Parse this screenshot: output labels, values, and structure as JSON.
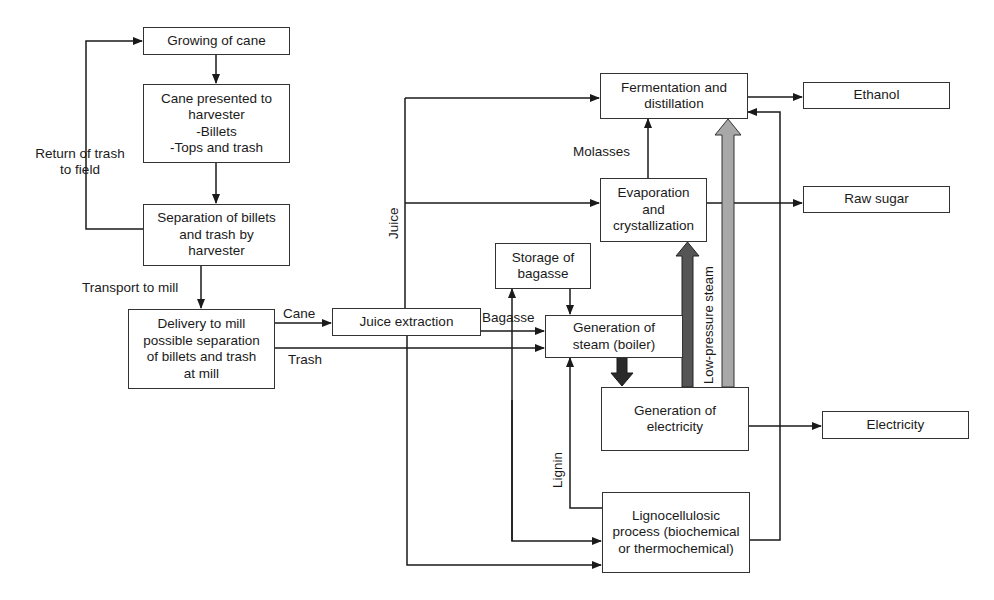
{
  "diagram": {
    "type": "process-flowchart",
    "nodes": {
      "growing": {
        "lines": [
          "Growing of cane"
        ]
      },
      "presented": {
        "lines": [
          "Cane presented to",
          "harvester",
          "-Billets",
          "-Tops and trash"
        ]
      },
      "separation": {
        "lines": [
          "Separation of billets",
          "and trash by",
          "harvester"
        ]
      },
      "delivery": {
        "lines": [
          "Delivery to mill",
          "possible separation",
          "of billets and trash",
          "at mill"
        ]
      },
      "juice_extraction": {
        "lines": [
          "Juice extraction"
        ]
      },
      "fermentation": {
        "lines": [
          "Fermentation and",
          "distillation"
        ]
      },
      "evaporation": {
        "lines": [
          "Evaporation",
          "and",
          "crystallization"
        ]
      },
      "storage": {
        "lines": [
          "Storage of",
          "bagasse"
        ]
      },
      "steam": {
        "lines": [
          "Generation of",
          "steam (boiler)"
        ]
      },
      "electricity_gen": {
        "lines": [
          "Generation of",
          "electricity"
        ]
      },
      "lignocellulosic": {
        "lines": [
          "Lignocellulosic",
          "process (biochemical",
          "or thermochemical)"
        ]
      },
      "ethanol": {
        "lines": [
          "Ethanol"
        ]
      },
      "raw_sugar": {
        "lines": [
          "Raw sugar"
        ]
      },
      "electricity": {
        "lines": [
          "Electricity"
        ]
      }
    },
    "edge_labels": {
      "return_trash": [
        "Return of trash",
        "to field"
      ],
      "transport": "Transport to mill",
      "cane": "Cane",
      "trash": "Trash",
      "bagasse": "Bagasse",
      "juice": "Juice",
      "molasses": "Molasses",
      "low_pressure_steam": "Low-pressure steam",
      "lignin": "Lignin"
    },
    "edges": [
      {
        "from": "growing",
        "to": "presented"
      },
      {
        "from": "presented",
        "to": "separation"
      },
      {
        "from": "separation",
        "to": "growing",
        "label": "Return of trash to field"
      },
      {
        "from": "separation",
        "to": "delivery",
        "label": "Transport to mill"
      },
      {
        "from": "delivery",
        "to": "juice_extraction",
        "label": "Cane"
      },
      {
        "from": "delivery",
        "to": "steam",
        "label": "Trash"
      },
      {
        "from": "juice_extraction",
        "to": "steam",
        "label": "Bagasse"
      },
      {
        "from": "juice_extraction",
        "to": "fermentation",
        "label": "Juice"
      },
      {
        "from": "juice_extraction",
        "to": "evaporation",
        "label": "Juice"
      },
      {
        "from": "juice_extraction",
        "to": "lignocellulosic"
      },
      {
        "from": "juice_extraction",
        "to": "storage"
      },
      {
        "from": "storage",
        "to": "steam"
      },
      {
        "from": "evaporation",
        "to": "fermentation",
        "label": "Molasses"
      },
      {
        "from": "evaporation",
        "to": "raw_sugar"
      },
      {
        "from": "fermentation",
        "to": "ethanol"
      },
      {
        "from": "steam",
        "to": "electricity_gen",
        "style": "thick-black"
      },
      {
        "from": "electricity_gen",
        "to": "evaporation",
        "style": "thick-darkgrey"
      },
      {
        "from": "electricity_gen",
        "to": "fermentation",
        "style": "thick-lightgrey",
        "label": "Low-pressure steam"
      },
      {
        "from": "electricity_gen",
        "to": "electricity"
      },
      {
        "from": "lignocellulosic",
        "to": "steam",
        "label": "Lignin"
      },
      {
        "from": "lignocellulosic",
        "to": "fermentation"
      }
    ],
    "colors": {
      "line": "#1a1a1a",
      "thick_black": "#2a2a2a",
      "thick_darkgrey": "#555555",
      "thick_lightgrey": "#a8a8a8"
    }
  }
}
